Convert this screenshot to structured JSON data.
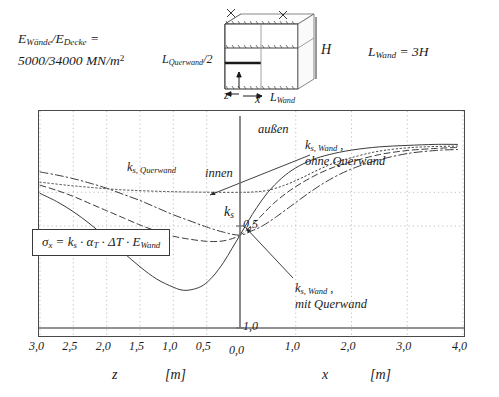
{
  "annotations": {
    "material_line1": "E_Wände/E_Decke =",
    "material_line1_parts": {
      "e1": "E",
      "e1sub": "Wände",
      "slash": "/",
      "e2": "E",
      "e2sub": "Decke",
      "eq": "="
    },
    "material_line2": "5000/34000 MN/m2",
    "material_values": "5000/34000 MN/m",
    "material_exp": "2",
    "lwand_label": "L",
    "lwand_sub": "Wand",
    "lwand_value": " = 3H"
  },
  "sketch": {
    "label_lquerwand": "L",
    "label_lquerwand_sub": "Querwand",
    "label_lquerwand_tail": "/2",
    "label_H": "H",
    "label_z": "z",
    "label_x": "x",
    "label_lwand": "L",
    "label_lwand_sub": "Wand"
  },
  "formula": {
    "sigma": "σ",
    "sigma_sub": "x",
    "eq": " = ",
    "k": "k",
    "k_sub": "s",
    "dot1": " · ",
    "alpha": "α",
    "alpha_sub": "T",
    "dot2": " · ",
    "deltaT": "ΔT",
    "dot3": " · ",
    "E": "E",
    "E_sub": "Wand",
    "full": "σx = ks · αT · ΔT · EWand"
  },
  "chart_data": {
    "type": "line",
    "title": "",
    "xlabel_left": "z",
    "xlabel_right": "x",
    "unit_left": "[m]",
    "unit_right": "[m]",
    "ylabel": "k",
    "ylabel_sub": "s",
    "axis_left_ticks": [
      "3,0",
      "2,5",
      "2,0",
      "1,5",
      "1,0",
      "0,5",
      "0,0"
    ],
    "axis_left_values": [
      3.0,
      2.5,
      2.0,
      1.5,
      1.0,
      0.5,
      0.0
    ],
    "axis_right_ticks": [
      "0,0",
      "1,0",
      "2,0",
      "3,0",
      "4,0"
    ],
    "axis_right_values": [
      0.0,
      1.0,
      2.0,
      3.0,
      4.0
    ],
    "y_ticks": [
      "0,5",
      "1,0"
    ],
    "y_values": [
      0.5,
      1.0
    ],
    "ylim": [
      0.0,
      1.12
    ],
    "grid": "dotted",
    "legend_position": "inline-annotations",
    "inner_outer": {
      "inner": "innen",
      "outer": "außen"
    },
    "annotation_querwand": {
      "label": "k",
      "sub": "s, Querwand"
    },
    "annotation_wand_ohne": {
      "line1_a": "k",
      "line1_sub": "s, Wand",
      "line1_b": " ,",
      "line2": "ohne Querwand"
    },
    "annotation_wand_mit": {
      "line1_a": "k",
      "line1_sub": "s, Wand",
      "line1_b": " ,",
      "line2": "mit Querwand"
    },
    "series": [
      {
        "name": "ks-solid",
        "style": "solid",
        "z_branch": [
          [
            3.0,
            0.34
          ],
          [
            2.75,
            0.38
          ],
          [
            2.5,
            0.43
          ],
          [
            2.25,
            0.49
          ],
          [
            2.0,
            0.56
          ],
          [
            1.75,
            0.63
          ],
          [
            1.5,
            0.7
          ],
          [
            1.25,
            0.76
          ],
          [
            1.0,
            0.8
          ],
          [
            0.85,
            0.815
          ],
          [
            0.7,
            0.81
          ],
          [
            0.55,
            0.79
          ],
          [
            0.4,
            0.745
          ],
          [
            0.25,
            0.68
          ],
          [
            0.12,
            0.61
          ],
          [
            0.0,
            0.545
          ]
        ],
        "x_branch": [
          [
            0.0,
            0.545
          ],
          [
            0.15,
            0.475
          ],
          [
            0.3,
            0.41
          ],
          [
            0.5,
            0.335
          ],
          [
            0.75,
            0.265
          ],
          [
            1.0,
            0.215
          ],
          [
            1.3,
            0.175
          ],
          [
            1.6,
            0.15
          ],
          [
            2.0,
            0.128
          ],
          [
            2.5,
            0.112
          ],
          [
            3.0,
            0.105
          ],
          [
            3.5,
            0.1
          ],
          [
            3.9,
            0.1
          ]
        ]
      },
      {
        "name": "ks-dashed",
        "style": "dashed",
        "z_branch": [
          [
            3.0,
            0.3
          ],
          [
            2.75,
            0.325
          ],
          [
            2.5,
            0.355
          ],
          [
            2.25,
            0.39
          ],
          [
            2.0,
            0.425
          ],
          [
            1.75,
            0.46
          ],
          [
            1.5,
            0.495
          ],
          [
            1.25,
            0.525
          ],
          [
            1.0,
            0.55
          ],
          [
            0.75,
            0.565
          ],
          [
            0.5,
            0.575
          ],
          [
            0.3,
            0.575
          ],
          [
            0.15,
            0.565
          ],
          [
            0.0,
            0.545
          ]
        ],
        "x_branch": [
          [
            0.0,
            0.545
          ],
          [
            0.2,
            0.5
          ],
          [
            0.4,
            0.445
          ],
          [
            0.6,
            0.39
          ],
          [
            0.85,
            0.335
          ],
          [
            1.1,
            0.29
          ],
          [
            1.4,
            0.245
          ],
          [
            1.7,
            0.21
          ],
          [
            2.0,
            0.185
          ],
          [
            2.5,
            0.15
          ],
          [
            3.0,
            0.13
          ],
          [
            3.5,
            0.12
          ],
          [
            3.9,
            0.115
          ]
        ]
      },
      {
        "name": "ks-dashdot",
        "style": "dashdot",
        "z_branch": [
          [
            3.0,
            0.235
          ],
          [
            2.75,
            0.25
          ],
          [
            2.5,
            0.268
          ],
          [
            2.25,
            0.29
          ],
          [
            2.0,
            0.315
          ],
          [
            1.75,
            0.345
          ],
          [
            1.5,
            0.375
          ],
          [
            1.25,
            0.41
          ],
          [
            1.0,
            0.445
          ],
          [
            0.75,
            0.475
          ],
          [
            0.5,
            0.505
          ],
          [
            0.25,
            0.53
          ],
          [
            0.0,
            0.545
          ]
        ],
        "x_branch": [
          [
            0.0,
            0.545
          ],
          [
            0.2,
            0.525
          ],
          [
            0.4,
            0.5
          ],
          [
            0.65,
            0.455
          ],
          [
            0.9,
            0.405
          ],
          [
            1.2,
            0.345
          ],
          [
            1.5,
            0.29
          ],
          [
            1.8,
            0.245
          ],
          [
            2.1,
            0.21
          ],
          [
            2.5,
            0.175
          ],
          [
            3.0,
            0.145
          ],
          [
            3.5,
            0.13
          ],
          [
            3.9,
            0.125
          ]
        ]
      },
      {
        "name": "ks-dotted",
        "style": "dotted",
        "z_branch": [
          [
            3.0,
            0.285
          ],
          [
            2.6,
            0.3
          ],
          [
            2.2,
            0.312
          ],
          [
            1.8,
            0.322
          ],
          [
            1.4,
            0.328
          ],
          [
            1.0,
            0.332
          ],
          [
            0.6,
            0.334
          ],
          [
            0.3,
            0.335
          ],
          [
            0.0,
            0.335
          ]
        ],
        "x_branch": [
          [
            0.0,
            0.335
          ],
          [
            0.25,
            0.333
          ],
          [
            0.5,
            0.325
          ],
          [
            0.8,
            0.3
          ],
          [
            1.1,
            0.265
          ],
          [
            1.4,
            0.225
          ],
          [
            1.7,
            0.19
          ],
          [
            2.0,
            0.165
          ],
          [
            2.4,
            0.138
          ],
          [
            2.8,
            0.122
          ],
          [
            3.3,
            0.112
          ],
          [
            3.9,
            0.108
          ]
        ]
      }
    ],
    "dotted_reference_y": 0.335
  }
}
